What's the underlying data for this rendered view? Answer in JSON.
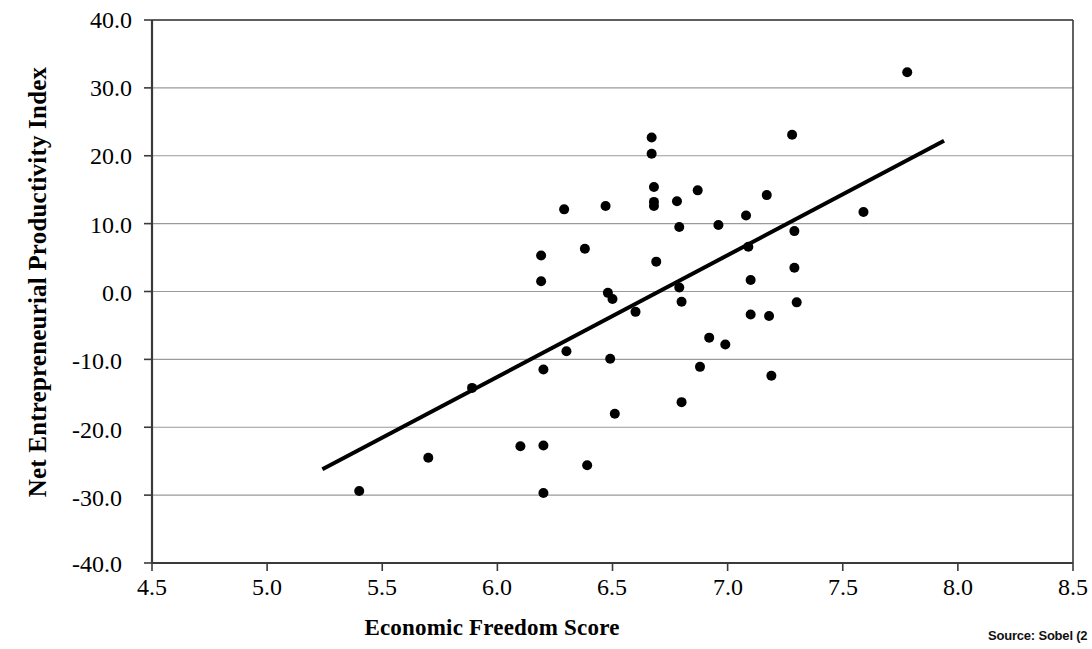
{
  "chart_data": {
    "type": "scatter",
    "title": "",
    "xlabel": "Economic Freedom Score",
    "ylabel": "Net Entrepreneurial Productivity Index",
    "xlim": [
      4.5,
      8.5
    ],
    "ylim": [
      -40.0,
      40.0
    ],
    "grid": true,
    "legend": null,
    "xticks": [
      "4.5",
      "5.0",
      "5.5",
      "6.0",
      "6.5",
      "7.0",
      "7.5",
      "8.0",
      "8.5"
    ],
    "yticks": [
      "40.0",
      "30.0",
      "20.0",
      "10.0",
      "0.0",
      "-10.0",
      "-20.0",
      "-30.0",
      "-40.0"
    ],
    "xtick_values": [
      4.5,
      5.0,
      5.5,
      6.0,
      6.5,
      7.0,
      7.5,
      8.0,
      8.5
    ],
    "ytick_values": [
      40.0,
      30.0,
      20.0,
      10.0,
      0.0,
      -10.0,
      -20.0,
      -30.0,
      -40.0
    ],
    "marker": "filled-circle",
    "marker_color": "#000000",
    "marker_size": 9,
    "points": [
      {
        "x": 5.4,
        "y": -29.4
      },
      {
        "x": 5.7,
        "y": -24.5
      },
      {
        "x": 5.89,
        "y": -14.2
      },
      {
        "x": 6.1,
        "y": -22.8
      },
      {
        "x": 6.19,
        "y": 5.3
      },
      {
        "x": 6.19,
        "y": 1.5
      },
      {
        "x": 6.2,
        "y": -11.5
      },
      {
        "x": 6.2,
        "y": -22.7
      },
      {
        "x": 6.2,
        "y": -29.7
      },
      {
        "x": 6.29,
        "y": 12.1
      },
      {
        "x": 6.3,
        "y": -8.8
      },
      {
        "x": 6.38,
        "y": 6.3
      },
      {
        "x": 6.39,
        "y": -25.6
      },
      {
        "x": 6.47,
        "y": 12.6
      },
      {
        "x": 6.48,
        "y": -0.2
      },
      {
        "x": 6.49,
        "y": -9.9
      },
      {
        "x": 6.5,
        "y": -1.1
      },
      {
        "x": 6.51,
        "y": -18.0
      },
      {
        "x": 6.6,
        "y": -3.0
      },
      {
        "x": 6.67,
        "y": 22.7
      },
      {
        "x": 6.67,
        "y": 20.3
      },
      {
        "x": 6.68,
        "y": 15.4
      },
      {
        "x": 6.68,
        "y": 13.2
      },
      {
        "x": 6.68,
        "y": 12.6
      },
      {
        "x": 6.69,
        "y": 4.4
      },
      {
        "x": 6.78,
        "y": 13.3
      },
      {
        "x": 6.79,
        "y": 9.5
      },
      {
        "x": 6.79,
        "y": 0.6
      },
      {
        "x": 6.8,
        "y": -1.5
      },
      {
        "x": 6.8,
        "y": -16.3
      },
      {
        "x": 6.87,
        "y": 14.9
      },
      {
        "x": 6.88,
        "y": -11.1
      },
      {
        "x": 6.92,
        "y": -6.8
      },
      {
        "x": 6.96,
        "y": 9.8
      },
      {
        "x": 6.99,
        "y": -7.8
      },
      {
        "x": 7.08,
        "y": 11.2
      },
      {
        "x": 7.09,
        "y": 6.6
      },
      {
        "x": 7.1,
        "y": 1.7
      },
      {
        "x": 7.1,
        "y": -3.4
      },
      {
        "x": 7.17,
        "y": 14.2
      },
      {
        "x": 7.18,
        "y": -3.6
      },
      {
        "x": 7.19,
        "y": -12.4
      },
      {
        "x": 7.28,
        "y": 23.1
      },
      {
        "x": 7.29,
        "y": 8.9
      },
      {
        "x": 7.29,
        "y": 3.5
      },
      {
        "x": 7.3,
        "y": -1.6
      },
      {
        "x": 7.59,
        "y": 11.7
      },
      {
        "x": 7.78,
        "y": 32.3
      }
    ],
    "trendline": {
      "type": "linear",
      "x_start": 5.24,
      "y_start": -26.2,
      "x_end": 7.94,
      "y_end": 22.2,
      "color": "#000000",
      "width": 4
    },
    "source": "Source: Sobel (2"
  },
  "axes": {
    "frame_color": "#3a3a3a",
    "grid_color": "#9a9a9a"
  }
}
